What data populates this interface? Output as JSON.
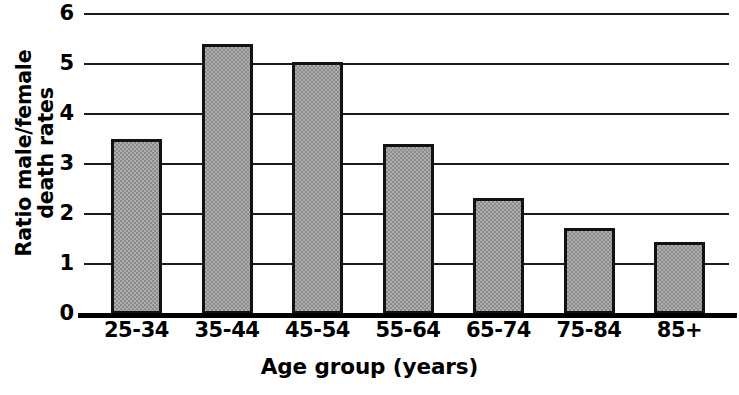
{
  "chart_data": {
    "type": "bar",
    "title": "",
    "xlabel": "Age group (years)",
    "ylabel": "Ratio male/female death rates",
    "ylabel_lines": [
      "Ratio male/female",
      "death rates"
    ],
    "categories": [
      "25-34",
      "35-44",
      "45-54",
      "55-64",
      "65-74",
      "75-84",
      "85+"
    ],
    "values": [
      3.5,
      5.4,
      5.05,
      3.4,
      2.33,
      1.72,
      1.44
    ],
    "series": [
      {
        "name": "Ratio male/female death rates",
        "values": [
          3.5,
          5.4,
          5.05,
          3.4,
          2.33,
          1.72,
          1.44
        ]
      }
    ],
    "ylim": [
      0,
      6
    ],
    "yticks": [
      0,
      1,
      2,
      3,
      4,
      5,
      6
    ],
    "ytick_labels": [
      "0",
      "1",
      "2",
      "3",
      "4",
      "5",
      "6"
    ],
    "grid": true,
    "grid_axis": "y",
    "legend": false,
    "legend_position": "none",
    "bar_fill_color": "#8b8b8b",
    "bar_edge_color": "#121212",
    "axis_color": "#000000",
    "background_color": "#ffffff"
  },
  "axes": {
    "y_title_line1": "Ratio male/female",
    "y_title_line2": "death rates",
    "x_title": "Age group (years)"
  }
}
